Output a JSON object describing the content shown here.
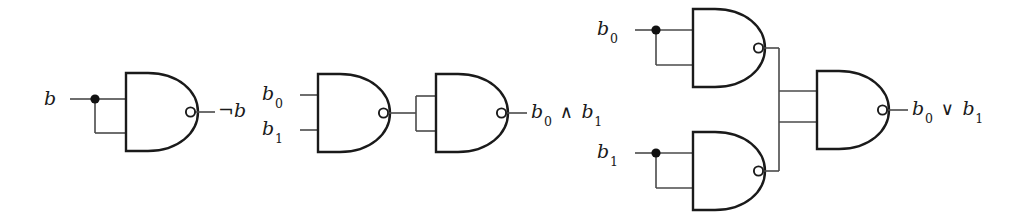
{
  "figure": {
    "background_color": "#ffffff",
    "wire_color": "#4a4a4a",
    "gate_outline_color": "#1a1a1a",
    "label_color": "#1a1a1a"
  },
  "circuits": [
    {
      "id": "not-circuit",
      "name": "NOT from NAND",
      "gate_count": 1,
      "inputs": [
        {
          "name": "b",
          "html": "b"
        }
      ],
      "output": {
        "name": "not-b",
        "html": "&not;b"
      },
      "gates": [
        {
          "name": "nand-gate-1",
          "type": "NAND",
          "inputs": 2
        }
      ]
    },
    {
      "id": "and-circuit",
      "name": "AND from NAND",
      "gate_count": 2,
      "inputs": [
        {
          "name": "b0",
          "html": "b<span class=\"sub\">0</span>"
        },
        {
          "name": "b1",
          "html": "b<span class=\"sub\">1</span>"
        }
      ],
      "output": {
        "name": "b0-and-b1",
        "html": "b<span class=\"sub\">0</span> <span class=\"op\">&and;</span> b<span class=\"sub\">1</span>"
      },
      "gates": [
        {
          "name": "nand-gate-1",
          "type": "NAND",
          "inputs": 2
        },
        {
          "name": "nand-gate-2",
          "type": "NAND",
          "inputs": 2
        }
      ]
    },
    {
      "id": "or-circuit",
      "name": "OR from NAND",
      "gate_count": 3,
      "inputs": [
        {
          "name": "b0",
          "html": "b<span class=\"sub\">0</span>"
        },
        {
          "name": "b1",
          "html": "b<span class=\"sub\">1</span>"
        }
      ],
      "output": {
        "name": "b0-or-b1",
        "html": "b<span class=\"sub\">0</span> <span class=\"op\">&or;</span> b<span class=\"sub\">1</span>"
      },
      "gates": [
        {
          "name": "nand-gate-top",
          "type": "NAND",
          "inputs": 2
        },
        {
          "name": "nand-gate-bottom",
          "type": "NAND",
          "inputs": 2
        },
        {
          "name": "nand-gate-right",
          "type": "NAND",
          "inputs": 2
        }
      ]
    }
  ],
  "labels": {
    "c1_in_b": "b",
    "c1_out_notb": "&not;b",
    "c2_in_b0": "b<span class=\"sub\">0</span>",
    "c2_in_b1": "b<span class=\"sub\">1</span>",
    "c2_out": "b<span class=\"sub\">0</span> <span class=\"op\">&and;</span> b<span class=\"sub\">1</span>",
    "c3_in_b0": "b<span class=\"sub\">0</span>",
    "c3_in_b1": "b<span class=\"sub\">1</span>",
    "c3_out": "b<span class=\"sub\">0</span> <span class=\"op\">&or;</span> b<span class=\"sub\">1</span>"
  }
}
